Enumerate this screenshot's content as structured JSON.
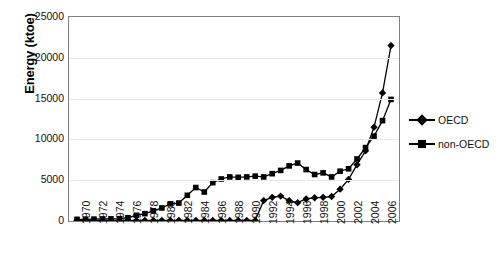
{
  "chart_data": {
    "type": "line",
    "title": "",
    "xlabel": "",
    "ylabel": "Energy (ktoe)",
    "ylim": [
      0,
      25000
    ],
    "yticks": [
      0,
      5000,
      10000,
      15000,
      20000,
      25000
    ],
    "ytick_labels": [
      "0",
      "5000",
      "10000",
      "15000",
      "20000",
      "25000"
    ],
    "grid": true,
    "legend_position": "right",
    "x": [
      1970,
      1971,
      1972,
      1973,
      1974,
      1975,
      1976,
      1977,
      1978,
      1979,
      1980,
      1981,
      1982,
      1983,
      1984,
      1985,
      1986,
      1987,
      1988,
      1989,
      1990,
      1991,
      1992,
      1993,
      1994,
      1995,
      1996,
      1997,
      1998,
      1999,
      2000,
      2001,
      2002,
      2003,
      2004,
      2005,
      2006,
      2007
    ],
    "xtick_labels": [
      "1970",
      "1972",
      "1974",
      "1976",
      "1978",
      "1980",
      "1982",
      "1984",
      "1986",
      "1988",
      "1990",
      "1992",
      "1994",
      "1996",
      "1998",
      "2000",
      "2002",
      "2004",
      "2006"
    ],
    "series": [
      {
        "name": "OECD",
        "marker": "diamond",
        "color": "#000000",
        "values": [
          60,
          60,
          60,
          60,
          60,
          60,
          60,
          60,
          60,
          60,
          60,
          60,
          60,
          60,
          60,
          60,
          60,
          60,
          60,
          60,
          60,
          60,
          2500,
          2900,
          3050,
          2500,
          2250,
          2700,
          2850,
          2900,
          3000,
          3900,
          5100,
          6900,
          8600,
          11500,
          15700,
          21500
        ]
      },
      {
        "name": "non-OECD",
        "marker": "square",
        "color": "#000000",
        "values": [
          200,
          210,
          230,
          250,
          260,
          280,
          400,
          700,
          900,
          1250,
          1600,
          2100,
          2200,
          3150,
          4100,
          3550,
          4700,
          5150,
          5400,
          5350,
          5400,
          5500,
          5400,
          5800,
          6200,
          6750,
          7100,
          6300,
          5700,
          5900,
          5400,
          6100,
          6400,
          7600,
          9000,
          10400,
          12300,
          14900
        ]
      }
    ]
  },
  "legend": {
    "items": [
      {
        "label": "OECD",
        "marker": "diamond"
      },
      {
        "label": "non-OECD",
        "marker": "square"
      }
    ]
  }
}
